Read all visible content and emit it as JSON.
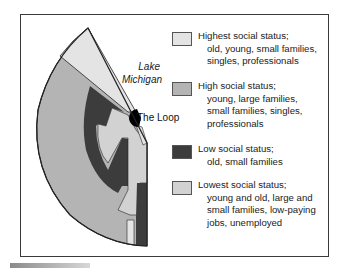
{
  "diagram": {
    "type": "multiple-nuclei / sector model map of Chicago",
    "labels": {
      "lake": [
        "Lake",
        "Michigan"
      ],
      "loop": "The Loop"
    },
    "colors": {
      "highest": "#e4e4e4",
      "high": "#b4b4b4",
      "low": "#3c3c3c",
      "lowest": "#d2d2d2",
      "loop": "#000000",
      "outline": "#222222"
    },
    "legend": [
      {
        "title": "Highest social status;",
        "lines": [
          "old, young, small families,",
          "singles, professionals"
        ],
        "color": "#e4e4e4"
      },
      {
        "title": "High social status;",
        "lines": [
          "young, large families,",
          "small families, singles,",
          "professionals"
        ],
        "color": "#b4b4b4"
      },
      {
        "title": "Low social status;",
        "lines": [
          "old, small families"
        ],
        "color": "#3c3c3c"
      },
      {
        "title": "Lowest social status;",
        "lines": [
          "young and old, large and",
          "small families, low-paying",
          "jobs, unemployed"
        ],
        "color": "#d2d2d2"
      }
    ]
  }
}
